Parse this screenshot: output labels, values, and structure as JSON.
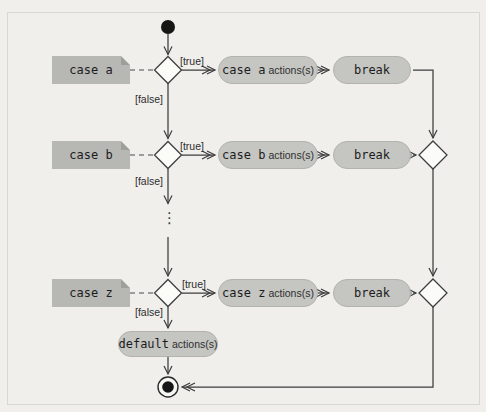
{
  "figure": {
    "rows": [
      {
        "note": "case a",
        "guard_true": "[true]",
        "guard_false": "[false]",
        "action_code": "case a",
        "action_suffix": "actions(s)",
        "break_label": "break"
      },
      {
        "note": "case b",
        "guard_true": "[true]",
        "guard_false": "[false]",
        "action_code": "case b",
        "action_suffix": "actions(s)",
        "break_label": "break"
      },
      {
        "note": "case z",
        "guard_true": "[true]",
        "guard_false": "[false]",
        "action_code": "case z",
        "action_suffix": "actions(s)",
        "break_label": "break"
      }
    ],
    "default_action": {
      "code": "default",
      "suffix": "actions(s)"
    },
    "ellipsis": "⋮"
  },
  "colors": {
    "background": "#f0efec",
    "note_fill": "#b7b7b4",
    "note_fold": "#9e9e9b",
    "action_fill": "#c5c5c2",
    "diamond_fill": "#fbfbf8",
    "line": "#3c3c3c",
    "text": "#1c1c1c"
  }
}
